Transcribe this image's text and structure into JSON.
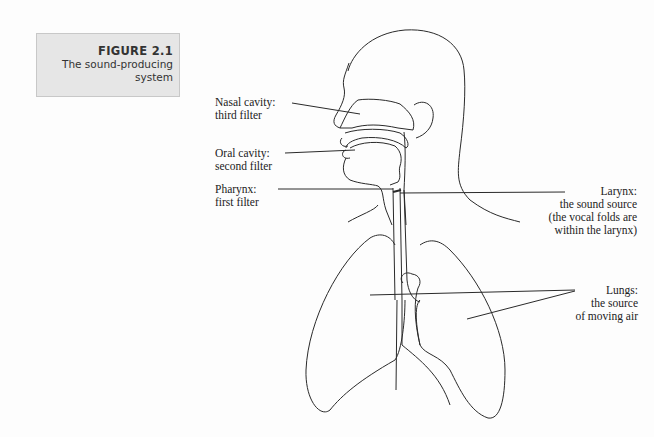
{
  "figure": {
    "number": "FIGURE 2.1",
    "title_line1": "The sound-producing",
    "title_line2": "system"
  },
  "labels": {
    "nasal": {
      "line1": "Nasal cavity:",
      "line2": "third filter"
    },
    "oral": {
      "line1": "Oral cavity:",
      "line2": "second filter"
    },
    "pharynx": {
      "line1": "Pharynx:",
      "line2": "first filter"
    },
    "larynx": {
      "line1": "Larynx:",
      "line2": "the sound source",
      "line3": "(the vocal folds are",
      "line4": "within the larynx)"
    },
    "lungs": {
      "line1": "Lungs:",
      "line2": "the source",
      "line3": "of moving air"
    }
  }
}
